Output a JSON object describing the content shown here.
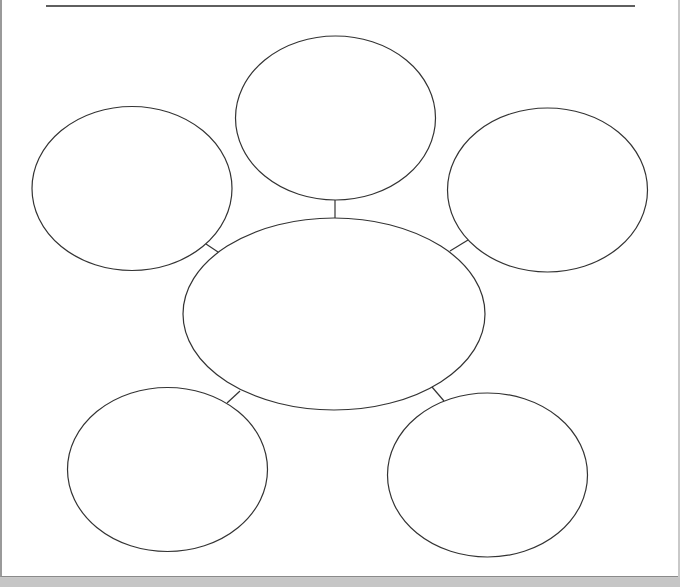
{
  "diagram": {
    "type": "bubble-map",
    "colors": {
      "stroke": "#333333",
      "page": "#ffffff",
      "background": "#c9c9c9"
    },
    "title_line": {
      "x1": 46,
      "y1": 6,
      "x2": 635,
      "y2": 6
    },
    "center_node": {
      "id": "center",
      "cx": 334,
      "cy": 314,
      "rx": 151,
      "ry": 96,
      "label": ""
    },
    "outer_nodes": [
      {
        "id": "top",
        "cx": 335.5,
        "cy": 118,
        "rx": 100,
        "ry": 82,
        "label": ""
      },
      {
        "id": "upper-left",
        "cx": 132,
        "cy": 188.5,
        "rx": 100,
        "ry": 82,
        "label": ""
      },
      {
        "id": "upper-right",
        "cx": 547.5,
        "cy": 190,
        "rx": 100,
        "ry": 82,
        "label": ""
      },
      {
        "id": "lower-left",
        "cx": 167.5,
        "cy": 469.5,
        "rx": 100,
        "ry": 82,
        "label": ""
      },
      {
        "id": "lower-right",
        "cx": 487.5,
        "cy": 475,
        "rx": 100,
        "ry": 82,
        "label": ""
      }
    ],
    "connectors": [
      {
        "from": "center",
        "to": "top",
        "x1": 335,
        "y1": 218,
        "x2": 335,
        "y2": 200
      },
      {
        "from": "center",
        "to": "upper-left",
        "x1": 218,
        "y1": 252,
        "x2": 206,
        "y2": 244
      },
      {
        "from": "center",
        "to": "upper-right",
        "x1": 450,
        "y1": 251,
        "x2": 468,
        "y2": 240
      },
      {
        "from": "center",
        "to": "lower-left",
        "x1": 240,
        "y1": 391,
        "x2": 227,
        "y2": 403
      },
      {
        "from": "center",
        "to": "lower-right",
        "x1": 432,
        "y1": 387,
        "x2": 444,
        "y2": 401
      }
    ]
  }
}
